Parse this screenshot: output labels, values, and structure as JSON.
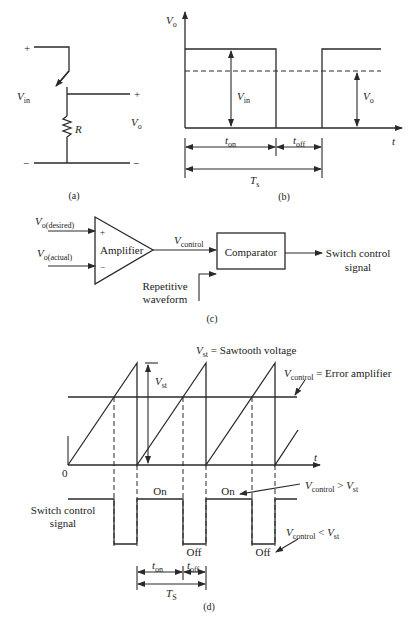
{
  "figure": {
    "panel_a": {
      "caption": "(a)",
      "labels": {
        "plus_top": "+",
        "vin_V": "V",
        "vin_sub": "in",
        "plus_out": "+",
        "r": "R",
        "vo_V": "V",
        "vo_sub": "o",
        "minus_left": "−",
        "minus_right": "−"
      }
    },
    "panel_b": {
      "caption": "(b)",
      "labels": {
        "y_axis_V": "V",
        "y_axis_sub": "o",
        "x_axis": "t",
        "vin_V": "V",
        "vin_sub": "in",
        "vo_V": "V",
        "vo_sub": "o",
        "ton_t": "t",
        "ton_sub": "on",
        "toff_t": "t",
        "toff_sub": "off",
        "ts_T": "T",
        "ts_sub": "s"
      }
    },
    "panel_c": {
      "caption": "(c)",
      "labels": {
        "vdes_V": "V",
        "vdes_sub": "o(desired)",
        "vact_V": "V",
        "vact_sub": "o(actual)",
        "plus": "+",
        "minus": "−",
        "amplifier": "Amplifier",
        "vctrl_V": "V",
        "vctrl_sub": "control",
        "comparator": "Comparator",
        "output_line1": "Switch control",
        "output_line2": "signal",
        "rep_line1": "Repetitive",
        "rep_line2": "waveform"
      }
    },
    "panel_d": {
      "caption": "(d)",
      "labels": {
        "vst_def_V": "V",
        "vst_def_sub": "st",
        "vst_def_text": " = Sawtooth voltage",
        "vctrl_def_V": "V",
        "vctrl_def_sub": "control",
        "vctrl_def_text": " = Error amplifier",
        "vst_V": "V",
        "vst_sub": "st",
        "zero": "0",
        "x_axis": "t",
        "switch_line1": "Switch control",
        "switch_line2": "signal",
        "on1": "On",
        "on2": "On",
        "off1": "Off",
        "off2": "Off",
        "gt_V1": "V",
        "gt_sub1": "control",
        "gt_op": " > ",
        "gt_V2": "V",
        "gt_sub2": "st",
        "lt_V1": "V",
        "lt_sub1": "control",
        "lt_op": " < ",
        "lt_V2": "V",
        "lt_sub2": "st",
        "ton_t": "t",
        "ton_sub": "on",
        "toff_t": "t",
        "toff_sub": "off",
        "ts_T": "T",
        "ts_sub": "S"
      }
    }
  }
}
